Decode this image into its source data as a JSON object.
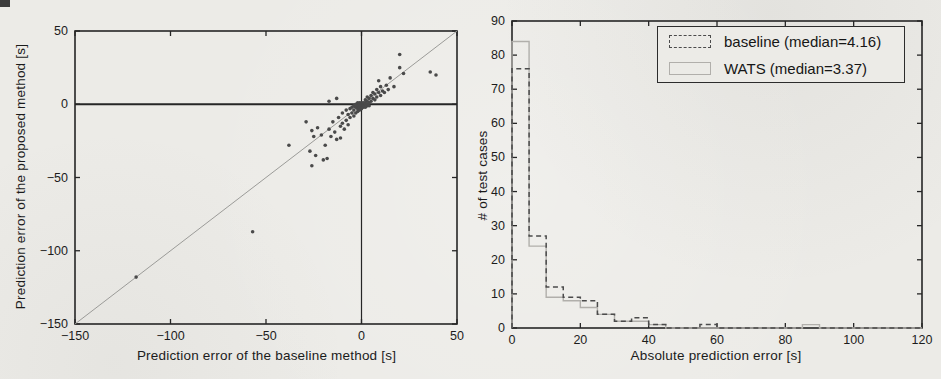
{
  "page": {
    "width": 941,
    "height": 379,
    "paper_color": "#ecebe7",
    "ink_color": "#262626"
  },
  "chart_data": [
    {
      "type": "scatter",
      "xlabel": "Prediction error of the baseline method [s]",
      "ylabel": "Prediction error of the proposed method [s]",
      "xlim": [
        -150,
        50
      ],
      "ylim": [
        -150,
        50
      ],
      "xticks": [
        -150,
        -100,
        -50,
        0,
        50
      ],
      "yticks": [
        -150,
        -100,
        -50,
        0,
        50
      ],
      "reference_lines": {
        "diagonal": "y=x",
        "hline_y": 0,
        "vline_x": 0
      },
      "point_color": "#4a4a4a",
      "diagonal_color": "#9b9b98",
      "points": [
        [
          -118,
          -118
        ],
        [
          -57,
          -87
        ],
        [
          -38,
          -28
        ],
        [
          -29,
          -12
        ],
        [
          -27,
          -32
        ],
        [
          -26,
          -42
        ],
        [
          -26,
          -18
        ],
        [
          -25,
          -22
        ],
        [
          -24,
          -35
        ],
        [
          -23,
          -16
        ],
        [
          -21,
          -21
        ],
        [
          -20,
          -38
        ],
        [
          -19,
          -28
        ],
        [
          -18,
          -37
        ],
        [
          -17,
          -17
        ],
        [
          -17,
          2
        ],
        [
          -16,
          -22
        ],
        [
          -15,
          -12
        ],
        [
          -14,
          -19
        ],
        [
          -13,
          -24
        ],
        [
          -13,
          4
        ],
        [
          -12,
          -9
        ],
        [
          -11,
          -15
        ],
        [
          -11,
          -23
        ],
        [
          -10,
          -13
        ],
        [
          -10,
          -6
        ],
        [
          -9,
          -17
        ],
        [
          -8,
          -11
        ],
        [
          -7,
          -14
        ],
        [
          -8,
          -4
        ],
        [
          -7,
          -7
        ],
        [
          -6,
          -9
        ],
        [
          -6,
          -3
        ],
        [
          -5,
          -6
        ],
        [
          -5,
          -2
        ],
        [
          -4,
          -8
        ],
        [
          -4,
          -4
        ],
        [
          -4,
          -1
        ],
        [
          -3,
          -6
        ],
        [
          -3,
          -2
        ],
        [
          -2,
          -5
        ],
        [
          -3,
          0
        ],
        [
          -2,
          -1
        ],
        [
          -2,
          -3
        ],
        [
          -2,
          1
        ],
        [
          -1,
          -2
        ],
        [
          -1,
          0
        ],
        [
          -1,
          -4
        ],
        [
          -1,
          1
        ],
        [
          0,
          -1
        ],
        [
          0,
          -3
        ],
        [
          0,
          0
        ],
        [
          0,
          1
        ],
        [
          1,
          -2
        ],
        [
          1,
          0
        ],
        [
          1,
          -1
        ],
        [
          1,
          1
        ],
        [
          2,
          -2
        ],
        [
          2,
          0
        ],
        [
          2,
          1
        ],
        [
          3,
          -1
        ],
        [
          3,
          0
        ],
        [
          3,
          2
        ],
        [
          4,
          -1
        ],
        [
          4,
          1
        ],
        [
          2,
          3
        ],
        [
          3,
          5
        ],
        [
          4,
          4
        ],
        [
          5,
          2
        ],
        [
          5,
          6
        ],
        [
          6,
          4
        ],
        [
          6,
          8
        ],
        [
          7,
          3
        ],
        [
          7,
          7
        ],
        [
          8,
          5
        ],
        [
          8,
          10
        ],
        [
          9,
          8
        ],
        [
          10,
          6
        ],
        [
          10,
          12
        ],
        [
          11,
          9
        ],
        [
          12,
          8
        ],
        [
          13,
          13
        ],
        [
          14,
          10
        ],
        [
          9,
          16
        ],
        [
          15,
          18
        ],
        [
          17,
          12
        ],
        [
          20,
          25
        ],
        [
          20,
          34
        ],
        [
          22,
          21
        ],
        [
          36,
          22
        ],
        [
          39,
          20
        ]
      ]
    },
    {
      "type": "step-histogram",
      "xlabel": "Absolute prediction error [s]",
      "ylabel": "# of test cases",
      "xlim": [
        0,
        120
      ],
      "ylim": [
        0,
        90
      ],
      "xticks": [
        0,
        20,
        40,
        60,
        80,
        100,
        120
      ],
      "yticks": [
        0,
        10,
        20,
        30,
        40,
        50,
        60,
        70,
        80,
        90
      ],
      "bin_width": 5,
      "bin_start": 0,
      "legend_position": "top-right",
      "series": [
        {
          "name": "baseline (median=4.16)",
          "style": "dashed",
          "color": "#4b4b4b",
          "median": 4.16,
          "counts": [
            76,
            27,
            12,
            9,
            8,
            4,
            2,
            3,
            1,
            0,
            0,
            1,
            0,
            0,
            0,
            0,
            0,
            0,
            0,
            0,
            0,
            0,
            0,
            0
          ]
        },
        {
          "name": "WATS (median=3.37)",
          "style": "solid",
          "color": "#b1afab",
          "median": 3.37,
          "counts": [
            84,
            24,
            9,
            8,
            6,
            4,
            2,
            2,
            1,
            0,
            0,
            0,
            0,
            0,
            0,
            0,
            0,
            1,
            0,
            0,
            0,
            0,
            0,
            0
          ]
        }
      ]
    }
  ]
}
